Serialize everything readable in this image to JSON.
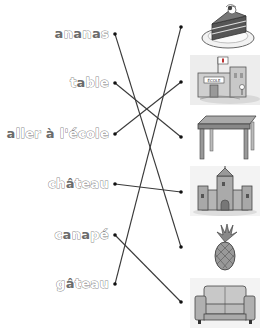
{
  "worksheet": {
    "words": [
      {
        "id": "ananas",
        "parts": [
          {
            "t": "a",
            "f": true
          },
          {
            "t": "n",
            "f": false
          },
          {
            "t": "a",
            "f": true
          },
          {
            "t": "n",
            "f": false
          },
          {
            "t": "a",
            "f": true
          },
          {
            "t": "s",
            "f": false
          }
        ],
        "text": "ananas",
        "dot": [
          115,
          34
        ],
        "top": 26
      },
      {
        "id": "table",
        "parts": [
          {
            "t": "t",
            "f": false
          },
          {
            "t": "a",
            "f": true
          },
          {
            "t": "ble",
            "f": false
          }
        ],
        "text": "table",
        "dot": [
          115,
          83
        ],
        "top": 75
      },
      {
        "id": "aller-a-lecole",
        "parts": [
          {
            "t": "a",
            "f": true
          },
          {
            "t": "ller ",
            "f": false
          },
          {
            "t": "à",
            "f": true
          },
          {
            "t": " l'école",
            "f": false
          }
        ],
        "text": "aller à l'école",
        "dot": [
          115,
          134
        ],
        "top": 126
      },
      {
        "id": "chateau",
        "parts": [
          {
            "t": "ch",
            "f": false
          },
          {
            "t": "â",
            "f": true
          },
          {
            "t": "teau",
            "f": false
          }
        ],
        "text": "château",
        "dot": [
          115,
          184
        ],
        "top": 176
      },
      {
        "id": "canape",
        "parts": [
          {
            "t": "c",
            "f": false
          },
          {
            "t": "a",
            "f": true
          },
          {
            "t": "n",
            "f": false
          },
          {
            "t": "a",
            "f": true
          },
          {
            "t": "pé",
            "f": false
          }
        ],
        "text": "canapé",
        "dot": [
          115,
          235
        ],
        "top": 227
      },
      {
        "id": "gateau",
        "parts": [
          {
            "t": "g",
            "f": false
          },
          {
            "t": "â",
            "f": true
          },
          {
            "t": "teau",
            "f": false
          }
        ],
        "text": "gâteau",
        "dot": [
          115,
          284
        ],
        "top": 276
      }
    ],
    "pictures": [
      {
        "id": "cake",
        "label": "cake-slice",
        "dot": [
          181,
          27
        ],
        "top": 2
      },
      {
        "id": "school",
        "label": "school-building",
        "dot": [
          181,
          82
        ],
        "top": 55
      },
      {
        "id": "table",
        "label": "table",
        "dot": [
          181,
          137
        ],
        "top": 112
      },
      {
        "id": "castle",
        "label": "castle",
        "dot": [
          181,
          192
        ],
        "top": 166
      },
      {
        "id": "pineapple",
        "label": "pineapple",
        "dot": [
          181,
          247
        ],
        "top": 222
      },
      {
        "id": "sofa",
        "label": "sofa",
        "dot": [
          181,
          302
        ],
        "top": 278
      }
    ],
    "school_sign": "ÉCOLE",
    "connections": [
      {
        "from": "ananas",
        "to": "pineapple"
      },
      {
        "from": "table",
        "to": "table"
      },
      {
        "from": "aller-a-lecole",
        "to": "school"
      },
      {
        "from": "chateau",
        "to": "castle"
      },
      {
        "from": "canape",
        "to": "sofa"
      },
      {
        "from": "gateau",
        "to": "cake"
      }
    ],
    "colors": {
      "line": "#3a3a3a",
      "outline_text": "#8a8a8a",
      "filled_text": "#6b6b6b"
    }
  }
}
